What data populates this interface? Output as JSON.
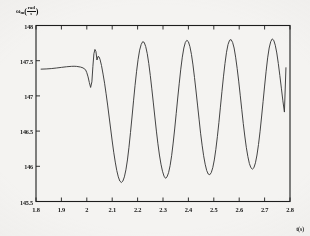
{
  "figure": {
    "background_color": "#f4f3f1",
    "line_color": "#3a3a3a",
    "axis_color": "#1d1d1d"
  },
  "axis_titles": {
    "y_symbol": "ω",
    "y_subscript": "m",
    "y_unit_numerator": "rad",
    "y_unit_denominator": "s",
    "y_paren_open": "(",
    "y_paren_close": ")",
    "x_title": "t(s)"
  },
  "chart_data": {
    "type": "line",
    "title": "",
    "xlabel": "t(s)",
    "ylabel": "ωm (rad/s)",
    "xlim": [
      1.8,
      2.8
    ],
    "ylim": [
      145.5,
      148.0
    ],
    "grid": false,
    "legend": null,
    "x_ticks": [
      1.8,
      1.9,
      2.0,
      2.1,
      2.2,
      2.3,
      2.4,
      2.5,
      2.6,
      2.7,
      2.8
    ],
    "x_tick_labels": [
      "1.8",
      "1.9",
      "2",
      "2.1",
      "2.2",
      "2.3",
      "2.4",
      "2.5",
      "2.6",
      "2.7",
      "2.8"
    ],
    "y_ticks": [
      145.5,
      146.0,
      146.5,
      147.0,
      147.5,
      148.0
    ],
    "y_tick_labels": [
      "145.5",
      "146",
      "146.5",
      "147",
      "147.5",
      "148"
    ],
    "series": [
      {
        "name": "ωm",
        "x": [
          1.82,
          1.84,
          1.86,
          1.88,
          1.9,
          1.92,
          1.94,
          1.95,
          1.96,
          1.975,
          1.985,
          1.995,
          2.0,
          2.005,
          2.01,
          2.015,
          2.02,
          2.024,
          2.028,
          2.032,
          2.036,
          2.04,
          2.044,
          2.048,
          2.052,
          2.058,
          2.064,
          2.07,
          2.076,
          2.082,
          2.088,
          2.094,
          2.1,
          2.106,
          2.112,
          2.118,
          2.124,
          2.13,
          2.136,
          2.142,
          2.148,
          2.154,
          2.16,
          2.166,
          2.172,
          2.178,
          2.184,
          2.19,
          2.196,
          2.202,
          2.208,
          2.214,
          2.22,
          2.226,
          2.232,
          2.238,
          2.244,
          2.25,
          2.256,
          2.262,
          2.268,
          2.274,
          2.28,
          2.286,
          2.292,
          2.298,
          2.304,
          2.31,
          2.316,
          2.322,
          2.328,
          2.334,
          2.34,
          2.346,
          2.352,
          2.358,
          2.364,
          2.37,
          2.376,
          2.382,
          2.388,
          2.394,
          2.4,
          2.406,
          2.412,
          2.418,
          2.424,
          2.43,
          2.436,
          2.442,
          2.448,
          2.454,
          2.46,
          2.466,
          2.472,
          2.478,
          2.484,
          2.49,
          2.496,
          2.502,
          2.508,
          2.514,
          2.52,
          2.526,
          2.532,
          2.538,
          2.544,
          2.55,
          2.556,
          2.562,
          2.568,
          2.574,
          2.58,
          2.586,
          2.592,
          2.598,
          2.604,
          2.61,
          2.616,
          2.622,
          2.628,
          2.634,
          2.64,
          2.646,
          2.652,
          2.658,
          2.664,
          2.67,
          2.676,
          2.682,
          2.688,
          2.694,
          2.7,
          2.706,
          2.712,
          2.718,
          2.724,
          2.73,
          2.736,
          2.742,
          2.748,
          2.754,
          2.76,
          2.766,
          2.772,
          2.778,
          2.784
        ],
        "y": [
          147.38,
          147.383,
          147.388,
          147.396,
          147.405,
          147.414,
          147.42,
          147.421,
          147.419,
          147.41,
          147.398,
          147.372,
          147.33,
          147.27,
          147.19,
          147.12,
          147.2,
          147.42,
          147.6,
          147.66,
          147.63,
          147.51,
          147.56,
          147.555,
          147.52,
          147.43,
          147.31,
          147.18,
          147.03,
          146.87,
          146.7,
          146.53,
          146.36,
          146.2,
          146.06,
          145.94,
          145.85,
          145.79,
          145.77,
          145.79,
          145.85,
          145.95,
          146.09,
          146.27,
          146.48,
          146.7,
          146.93,
          147.15,
          147.35,
          147.52,
          147.65,
          147.73,
          147.77,
          147.76,
          147.7,
          147.6,
          147.46,
          147.29,
          147.1,
          146.9,
          146.7,
          146.5,
          146.32,
          146.16,
          146.03,
          145.93,
          145.86,
          145.83,
          145.85,
          145.91,
          146.01,
          146.15,
          146.33,
          146.53,
          146.75,
          146.97,
          147.18,
          147.38,
          147.55,
          147.68,
          147.76,
          147.79,
          147.77,
          147.7,
          147.59,
          147.44,
          147.26,
          147.07,
          146.87,
          146.67,
          146.47,
          146.3,
          146.15,
          146.03,
          145.94,
          145.89,
          145.88,
          145.91,
          145.98,
          146.09,
          146.24,
          146.42,
          146.62,
          146.84,
          147.06,
          147.27,
          147.46,
          147.62,
          147.73,
          147.79,
          147.8,
          147.76,
          147.68,
          147.55,
          147.39,
          147.21,
          147.01,
          146.81,
          146.61,
          146.43,
          146.27,
          146.14,
          146.04,
          145.98,
          145.96,
          145.98,
          146.05,
          146.16,
          146.31,
          146.49,
          146.7,
          146.92,
          147.14,
          147.35,
          147.54,
          147.68,
          147.77,
          147.81,
          147.79,
          147.72,
          147.61,
          147.46,
          147.29,
          147.11,
          146.93,
          146.77,
          147.4
        ]
      }
    ],
    "annotations": [
      {
        "label": "steady pre-fault region",
        "x_range": [
          1.82,
          2.0
        ],
        "approx_y": 147.4
      },
      {
        "label": "transient dip",
        "x": 2.015,
        "y": 147.12
      },
      {
        "label": "transient spike",
        "x": 2.032,
        "y": 147.66
      },
      {
        "label": "oscillation peak max",
        "approx_y": 147.8
      },
      {
        "label": "oscillation trough min",
        "approx_y": 145.78
      },
      {
        "label": "oscillation period",
        "value": 0.155
      }
    ]
  }
}
